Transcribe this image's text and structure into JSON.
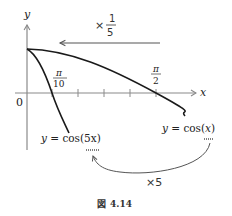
{
  "figure": {
    "caption_prefix": "図",
    "caption_number": "4.14"
  },
  "axes": {
    "x_label": "x",
    "y_label": "y",
    "origin_label": "0",
    "tick_count": 5
  },
  "annotations": {
    "scale_left": {
      "times": "×",
      "num": "1",
      "den": "5"
    },
    "pi_over_10": {
      "num": "π",
      "den": "10"
    },
    "pi_over_2": {
      "num": "π",
      "den": "2"
    },
    "scale_arrow_label": "×5"
  },
  "curves": [
    {
      "name": "cos5x",
      "label_prefix": "y = cos(",
      "label_arg": "5x",
      "label_suffix": ")"
    },
    {
      "name": "cosx",
      "label_prefix": "y = cos(",
      "label_arg": "x",
      "label_suffix": ")"
    }
  ],
  "colors": {
    "axis": "#8a8a8a",
    "curve": "#1a1a1a",
    "arrow": "#555555",
    "text": "#222222"
  }
}
